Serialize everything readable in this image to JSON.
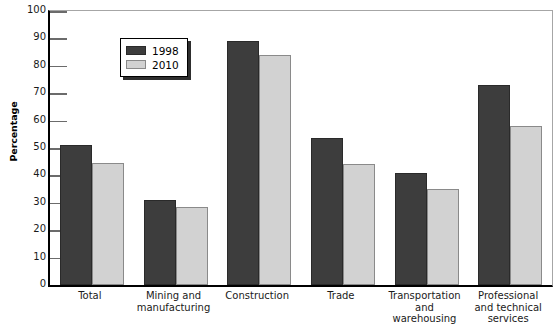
{
  "chart_data": {
    "type": "bar",
    "title": "",
    "xlabel": "",
    "ylabel": "Percentage",
    "ylim": [
      0,
      100
    ],
    "ytick_step": 10,
    "yticks": [
      "100",
      "90",
      "80",
      "70",
      "60",
      "50",
      "40",
      "30",
      "20",
      "10",
      "0"
    ],
    "grid": false,
    "legend_position": "top-left inside plot",
    "categories": [
      "Total",
      "Mining and manufacturing",
      "Construction",
      "Trade",
      "Transportation and warehousing",
      "Professional and technical services"
    ],
    "category_label_lines": [
      [
        "Total"
      ],
      [
        "Mining and",
        "manufacturing"
      ],
      [
        "Construction"
      ],
      [
        "Trade"
      ],
      [
        "Transportation",
        "and",
        "warehousing"
      ],
      [
        "Professional",
        "and technical",
        "services"
      ]
    ],
    "series": [
      {
        "name": "1998",
        "color": "#3d3d3d",
        "values": [
          51,
          31,
          89,
          53.5,
          41,
          73
        ]
      },
      {
        "name": "2010",
        "color": "#d2d2d2",
        "values": [
          44.5,
          28.5,
          84,
          44,
          35,
          58
        ]
      }
    ]
  },
  "legend": {
    "entries": [
      {
        "label": "1998"
      },
      {
        "label": "2010"
      }
    ]
  },
  "colors": {
    "series_1998": "#3d3d3d",
    "series_2010": "#d2d2d2",
    "axis": "#000000",
    "frame": "#a6a6a6",
    "background": "#ffffff"
  }
}
